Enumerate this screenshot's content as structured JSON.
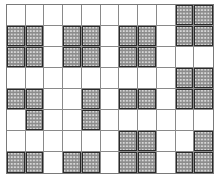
{
  "diagram": {
    "type": "grid-pattern",
    "rows": 8,
    "cols": 11,
    "colors": {
      "background": "#ffffff",
      "grid_line": "#8a8a8a",
      "shaded_fill": "#8c8c8c",
      "shaded_dots": "#d8d8d8",
      "shaded_border": "#2a2a2a"
    },
    "cells": [
      [
        0,
        0,
        0,
        0,
        0,
        0,
        0,
        0,
        0,
        1,
        1
      ],
      [
        1,
        1,
        0,
        1,
        1,
        0,
        1,
        1,
        0,
        1,
        1
      ],
      [
        1,
        1,
        0,
        1,
        1,
        0,
        1,
        1,
        0,
        0,
        0
      ],
      [
        0,
        0,
        0,
        0,
        0,
        0,
        0,
        0,
        0,
        1,
        1
      ],
      [
        1,
        1,
        0,
        0,
        1,
        0,
        1,
        1,
        0,
        1,
        1
      ],
      [
        0,
        1,
        0,
        0,
        1,
        0,
        0,
        0,
        0,
        0,
        0
      ],
      [
        0,
        0,
        0,
        0,
        0,
        0,
        1,
        1,
        0,
        0,
        1
      ],
      [
        1,
        1,
        0,
        1,
        1,
        0,
        1,
        1,
        0,
        1,
        1
      ]
    ]
  }
}
